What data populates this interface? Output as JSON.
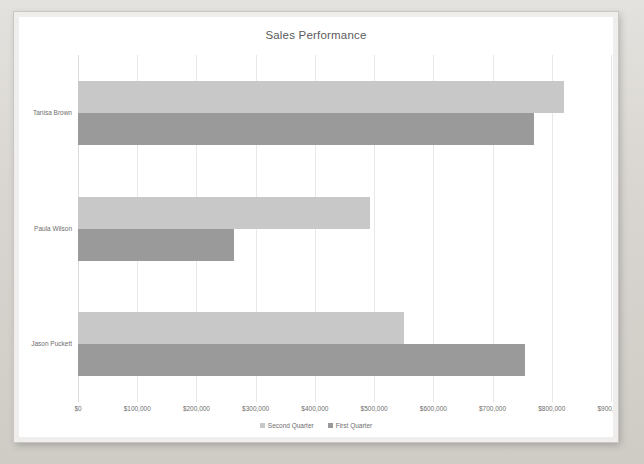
{
  "chart_data": {
    "type": "bar",
    "orientation": "horizontal",
    "title": "Sales Performance",
    "xlabel": "",
    "ylabel": "",
    "categories": [
      "Jason Puckett",
      "Paula Wilson",
      "Tanisa Brown"
    ],
    "series": [
      {
        "name": "Second Quarter",
        "color": "#c8c8c8",
        "values": [
          550000,
          493000,
          820000
        ]
      },
      {
        "name": "First Quarter",
        "color": "#9a9a9a",
        "values": [
          755000,
          264000,
          770000
        ]
      }
    ],
    "xlim": [
      0,
      900000
    ],
    "xticks": [
      0,
      100000,
      200000,
      300000,
      400000,
      500000,
      600000,
      700000,
      800000,
      900000
    ],
    "xtick_labels": [
      "$0",
      "$100,000",
      "$200,000",
      "$300,000",
      "$400,000",
      "$500,000",
      "$600,000",
      "$700,000",
      "$800,000",
      "$900,000"
    ],
    "grid": true,
    "legend_position": "bottom"
  },
  "legend": {
    "items": [
      {
        "label": "Second Quarter",
        "color": "#c8c8c8"
      },
      {
        "label": "First Quarter",
        "color": "#9a9a9a"
      }
    ]
  },
  "colors": {
    "second_quarter": "#c8c8c8",
    "first_quarter": "#9a9a9a",
    "gridline": "#e8e8e8",
    "text": "#6e6e6e",
    "title_text": "#5b5b5b",
    "plot_background": "#ffffff",
    "frame": "#efeeec",
    "desktop": "#d9d6d1"
  }
}
